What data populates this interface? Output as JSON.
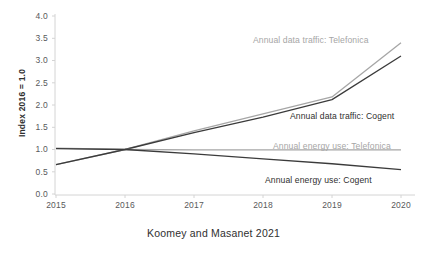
{
  "caption": "Koomey and Masanet 2021",
  "chart_data": {
    "type": "line",
    "title": "",
    "xlabel": "",
    "ylabel": "Index 2016 = 1.0",
    "x": [
      2015,
      2016,
      2017,
      2018,
      2019,
      2020
    ],
    "xtick_labels": [
      "2015",
      "2016",
      "2017",
      "2018",
      "2019",
      "2020"
    ],
    "xlim": [
      2015,
      2020
    ],
    "ylim": [
      0.0,
      4.0
    ],
    "ytick_labels": [
      "0.0",
      "0.5",
      "1.0",
      "1.5",
      "2.0",
      "2.5",
      "3.0",
      "3.5",
      "4.0"
    ],
    "yticks": [
      0.0,
      0.5,
      1.0,
      1.5,
      2.0,
      2.5,
      3.0,
      3.5,
      4.0
    ],
    "grid": false,
    "legend_position": "inline-annotations",
    "series": [
      {
        "name": "Annual data traffic: Telefonica",
        "color": "#a6a6a6",
        "values": [
          0.66,
          1.0,
          1.42,
          1.8,
          2.18,
          3.4
        ],
        "annotation": "Annual data traffic: Telefonica"
      },
      {
        "name": "Annual data traffic: Cogent",
        "color": "#3b3b3b",
        "values": [
          0.66,
          1.0,
          1.38,
          1.73,
          2.12,
          3.1
        ],
        "annotation": "Annual data traffic: Cogent"
      },
      {
        "name": "Annual energy use: Telefonica",
        "color": "#a6a6a6",
        "values": [
          1.03,
          1.0,
          0.99,
          0.99,
          0.99,
          0.99
        ],
        "annotation": "Annual energy use: Telefonica"
      },
      {
        "name": "Annual energy use: Cogent",
        "color": "#3b3b3b",
        "values": [
          1.02,
          1.0,
          0.9,
          0.79,
          0.68,
          0.55
        ],
        "annotation": "Annual energy use: Cogent"
      }
    ]
  },
  "annotations": {
    "traffic_telefonica": "Annual data traffic: Telefonica",
    "traffic_cogent": "Annual data traffic: Cogent",
    "energy_telefonica": "Annual energy use: Telefonica",
    "energy_cogent": "Annual energy use: Cogent"
  },
  "colors": {
    "gray_series": "#a6a6a6",
    "dark_series": "#3b3b3b",
    "axis": "#d0d0d0",
    "tick_text": "#58595b",
    "label_text": "#2f2f2f"
  },
  "axis": {
    "y_ticks": [
      "4.0",
      "3.5",
      "3.0",
      "2.5",
      "2.0",
      "1.5",
      "1.0",
      "0.5",
      "0.0"
    ],
    "x_ticks": [
      "2015",
      "2016",
      "2017",
      "2018",
      "2019",
      "2020"
    ],
    "y_title": "Index 2016 = 1.0"
  }
}
